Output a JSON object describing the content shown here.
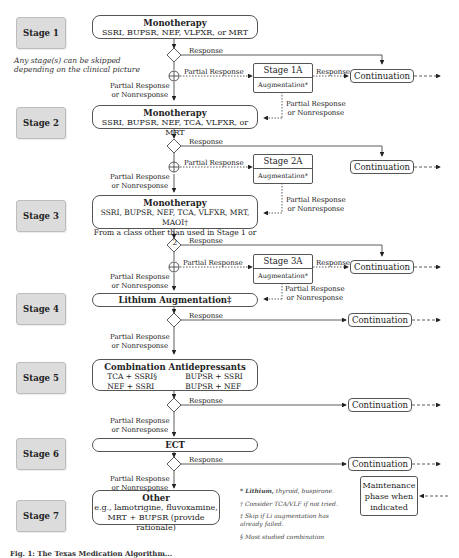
{
  "stages": [
    {
      "label": "Stage 1"
    },
    {
      "label": "Stage 2"
    },
    {
      "label": "Stage 3"
    },
    {
      "label": "Stage 4"
    },
    {
      "label": "Stage 5"
    },
    {
      "label": "Stage 6"
    },
    {
      "label": "Stage 7"
    }
  ],
  "note": {
    "line1": "Any stage(s) can be skipped",
    "line2": "depending on the clinical picture"
  },
  "treatments": {
    "s1": {
      "title": "Monotherapy",
      "line1": "SSRI, BUPSR, NEF, VLFXR, or MRT"
    },
    "s2": {
      "title": "Monotherapy",
      "line1": "SSRI, BUPSR, NEF, TCA, VLFXR, or MRT"
    },
    "s3": {
      "title": "Monotherapy",
      "line1": "SSRI, BUPSR, NEF, TCA, VLFXR, MRT, MAOI†",
      "line2": "From a class other than used in Stage 1 or 2"
    },
    "s4": {
      "title": "Lithium Augmentation‡"
    },
    "s5": {
      "title": "Combination Antidepressants",
      "c1a": "TCA + SSRI§",
      "c1b": "NEF + SSRI",
      "c2a": "BUPSR + SSRI",
      "c2b": "BUPSR + NEF"
    },
    "s6": {
      "title": "ECT"
    },
    "s7": {
      "title": "Other",
      "line1": "e.g., lamotrigine, fluvoxamine,",
      "line2": "MRT + BUPSR (provide rationale)"
    }
  },
  "augmentation": [
    {
      "title": "Stage 1A",
      "sub": "Augmentation*"
    },
    {
      "title": "Stage 2A",
      "sub": "Augmentation*"
    },
    {
      "title": "Stage 3A",
      "sub": "Augmentation*"
    }
  ],
  "labels": {
    "response": "Response",
    "partial_response": "Partial Response",
    "pr_nr_line1": "Partial Response",
    "pr_nr_line2": "or Nonresponse"
  },
  "continuation": "Continuation",
  "maintenance": {
    "line1": "Maintenance",
    "line2": "phase when",
    "line3": "indicated"
  },
  "footnotes": {
    "f1_bold": "* Lithium,",
    "f1_rest": " thyroid, buspirone.",
    "f2": "† Consider TCA/VLF if not tried.",
    "f3a": "‡ Skip if Li augmentation has",
    "f3b": "already failed.",
    "f4": "§ Most studied combination"
  },
  "caption": "Fig. 1: The Texas Medication Algorithm..."
}
